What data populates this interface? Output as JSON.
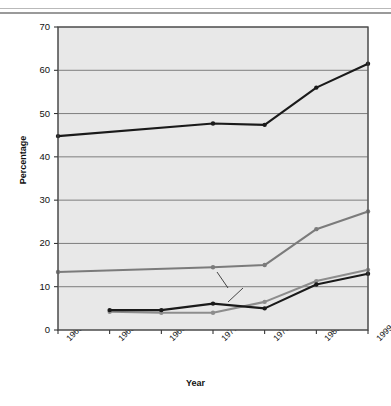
{
  "chart_data": {
    "type": "line",
    "title": "",
    "xlabel": "Year",
    "ylabel": "Percentage",
    "ylim": [
      0,
      70
    ],
    "ytick_step": 10,
    "yticks": [
      0,
      10,
      20,
      30,
      40,
      50,
      60,
      70
    ],
    "grid": "horizontal",
    "legend_position": "inline-annotations",
    "plot_background": "#e8e8e8",
    "categories": [
      "1960–62",
      "1963–65",
      "1966–70",
      "1971–74",
      "1976–80",
      "1988–94",
      "1999"
    ],
    "series": [
      {
        "name": "Overweight 20–74 years",
        "color": "#1a1a1a",
        "values": [
          44.8,
          null,
          null,
          47.7,
          47.4,
          56.0,
          61.5
        ]
      },
      {
        "name": "Obesity 20–74 years",
        "color": "#7b7b7b",
        "values": [
          13.4,
          null,
          null,
          14.5,
          15.0,
          23.3,
          27.4
        ]
      },
      {
        "name": "Overweight 6–11 years",
        "color": "#8d8d8d",
        "values": [
          null,
          4.2,
          4.0,
          4.0,
          6.5,
          11.3,
          13.9
        ]
      },
      {
        "name": "Overweight 12–19 years",
        "color": "#1a1a1a",
        "values": [
          null,
          4.6,
          4.6,
          6.1,
          5.0,
          10.5,
          13.0
        ]
      }
    ],
    "annotations": [
      {
        "text": "Overweight 20–74 years",
        "x_pct": 59.5,
        "y_pct": 14.0
      },
      {
        "text": "Obesity 20–74 years",
        "x_pct": 62.0,
        "y_pct": 52.6
      },
      {
        "text": "Overweight 6–11 years",
        "x_pct": 52.0,
        "y_pct": 65.0
      },
      {
        "text": "Overweight 12–19 years",
        "x_pct": 51.0,
        "y_pct": 77.0
      }
    ]
  }
}
